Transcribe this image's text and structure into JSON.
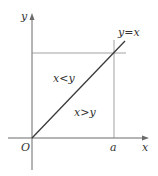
{
  "diagram": {
    "axis_labels": {
      "x": "x",
      "y": "y"
    },
    "origin_label": "O",
    "x_marker_label": "a",
    "line_label": "y=x",
    "regions": {
      "upper": "x<y",
      "lower": "x>y"
    }
  }
}
